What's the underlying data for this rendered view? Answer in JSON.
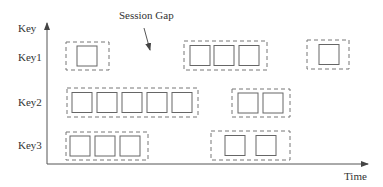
{
  "diagram": {
    "axis": {
      "y_label": "Key",
      "x_label": "Time"
    },
    "annotation": {
      "text": "Session Gap"
    },
    "colors": {
      "stroke": "#666666",
      "dashed": "#777777",
      "text": "#333333"
    },
    "keys": [
      {
        "label": "Key1",
        "sessions": [
          {
            "x": 66,
            "y": 42,
            "w": 43,
            "h": 28,
            "events": [
              77
            ]
          },
          {
            "x": 184,
            "y": 41,
            "w": 83,
            "h": 29,
            "events": [
              190,
              214,
              239
            ]
          },
          {
            "x": 307,
            "y": 40,
            "w": 42,
            "h": 29,
            "events": [
              319
            ]
          }
        ]
      },
      {
        "label": "Key2",
        "sessions": [
          {
            "x": 67,
            "y": 88,
            "w": 131,
            "h": 29,
            "events": [
              72,
              97,
              122,
              147,
              172
            ]
          },
          {
            "x": 232,
            "y": 89,
            "w": 58,
            "h": 28,
            "events": [
              238,
              263
            ]
          }
        ]
      },
      {
        "label": "Key3",
        "sessions": [
          {
            "x": 66,
            "y": 132,
            "w": 82,
            "h": 28,
            "events": [
              70,
              95,
              120
            ]
          },
          {
            "x": 211,
            "y": 131,
            "w": 79,
            "h": 29,
            "events": [
              225,
              256
            ]
          }
        ]
      }
    ]
  }
}
